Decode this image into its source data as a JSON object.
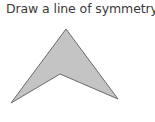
{
  "prompt": {
    "text": "Draw a line of symmetry."
  },
  "shape": {
    "type": "arrowhead-polygon",
    "fill": "#c4c4c4",
    "stroke": "#6a6a6a",
    "points": "66,29 118,99 60,74 11,103"
  }
}
